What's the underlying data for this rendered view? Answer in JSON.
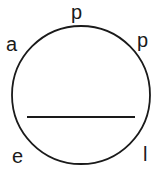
{
  "diagram": {
    "shape": "circle",
    "stroke_color": "#1a1a1a",
    "letters": [
      {
        "id": "a",
        "text": "a",
        "x": 6,
        "y": 34
      },
      {
        "id": "p1",
        "text": "p",
        "x": 71,
        "y": 2
      },
      {
        "id": "p2",
        "text": "p",
        "x": 137,
        "y": 30
      },
      {
        "id": "l",
        "text": "l",
        "x": 143,
        "y": 144
      },
      {
        "id": "e",
        "text": "e",
        "x": 12,
        "y": 146
      }
    ],
    "chord": {
      "x1": 27,
      "y1": 117,
      "x2": 135,
      "y2": 117
    }
  }
}
